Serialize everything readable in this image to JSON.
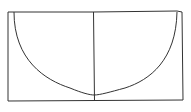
{
  "diagram": {
    "stroke_color": "#333333",
    "background": "#ffffff",
    "outer_rect": {
      "x1": 7,
      "y1": 11,
      "x2": 183,
      "y2": 101
    },
    "center_line": {
      "x": 94,
      "y1": 11,
      "y2": 101
    },
    "curve": {
      "start": [
        14,
        12
      ],
      "bottom": [
        94,
        95
      ],
      "end": [
        177,
        12
      ]
    }
  }
}
